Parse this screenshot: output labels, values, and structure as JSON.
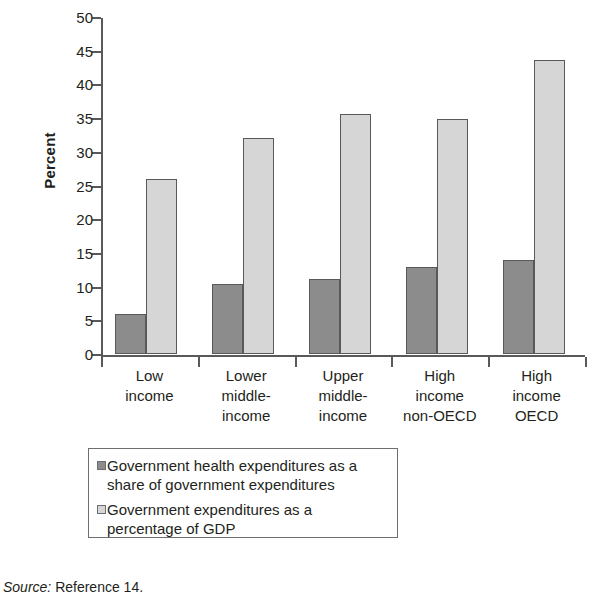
{
  "chart_data": {
    "type": "bar",
    "title": "",
    "xlabel": "",
    "ylabel": "Percent",
    "ylim": [
      0,
      50
    ],
    "ytick_step": 5,
    "yticks": [
      50,
      45,
      40,
      35,
      30,
      25,
      20,
      15,
      10,
      5,
      0
    ],
    "grid": false,
    "legend_position": "below-axes",
    "categories": [
      "Low income",
      "Lower middle-income",
      "Upper middle-income",
      "High income non-OECD",
      "High income OECD"
    ],
    "category_lines": [
      [
        "Low",
        "income"
      ],
      [
        "Lower",
        "middle-",
        "income"
      ],
      [
        "Upper",
        "middle-",
        "income"
      ],
      [
        "High",
        "income",
        "non-OECD"
      ],
      [
        "High",
        "income",
        "OECD"
      ]
    ],
    "series": [
      {
        "name": "Government health expenditures as a share of government expenditures",
        "legend_lines": [
          "Government health expenditures as a",
          "share of government expenditures"
        ],
        "color": "#8c8c8c",
        "values": [
          6.0,
          10.4,
          11.2,
          12.9,
          14.0
        ]
      },
      {
        "name": "Government expenditures as a percentage of GDP",
        "legend_lines": [
          "Government expenditures as a",
          "percentage of GDP"
        ],
        "color": "#d6d6d6",
        "values": [
          26.0,
          32.1,
          35.6,
          34.8,
          43.6
        ]
      }
    ]
  },
  "axis": {
    "y_title": "Percent"
  },
  "source": {
    "label": "Source:",
    "text": " Reference 14."
  },
  "colors": {
    "series0": "#8c8c8c",
    "series1": "#d6d6d6",
    "axis": "#58595b",
    "text": "#231f20",
    "legend_border": "#6d6e71"
  }
}
